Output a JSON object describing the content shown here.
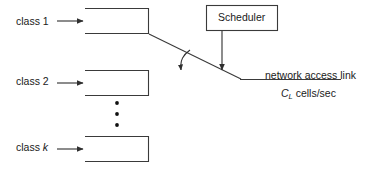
{
  "diagram": {
    "stroke_color": "#3a3a3a",
    "text_color": "#1a1a1a",
    "background_color": "#ffffff",
    "queues": [
      {
        "label": "class 1",
        "label_plain": "class 1",
        "italic_part": ""
      },
      {
        "label": "class 2",
        "label_plain": "class 2",
        "italic_part": ""
      },
      {
        "label": "class k",
        "label_plain": "class ",
        "italic_part": "k"
      }
    ],
    "scheduler": {
      "label": "Scheduler"
    },
    "link": {
      "name": "network access link",
      "capacity_symbol": "C",
      "capacity_subscript": "L",
      "capacity_units": "cells/sec",
      "capacity_full": "C_L cells/sec"
    },
    "ellipsis": {
      "dot_count": 3,
      "meaning": "additional classes between class 2 and class k"
    }
  }
}
